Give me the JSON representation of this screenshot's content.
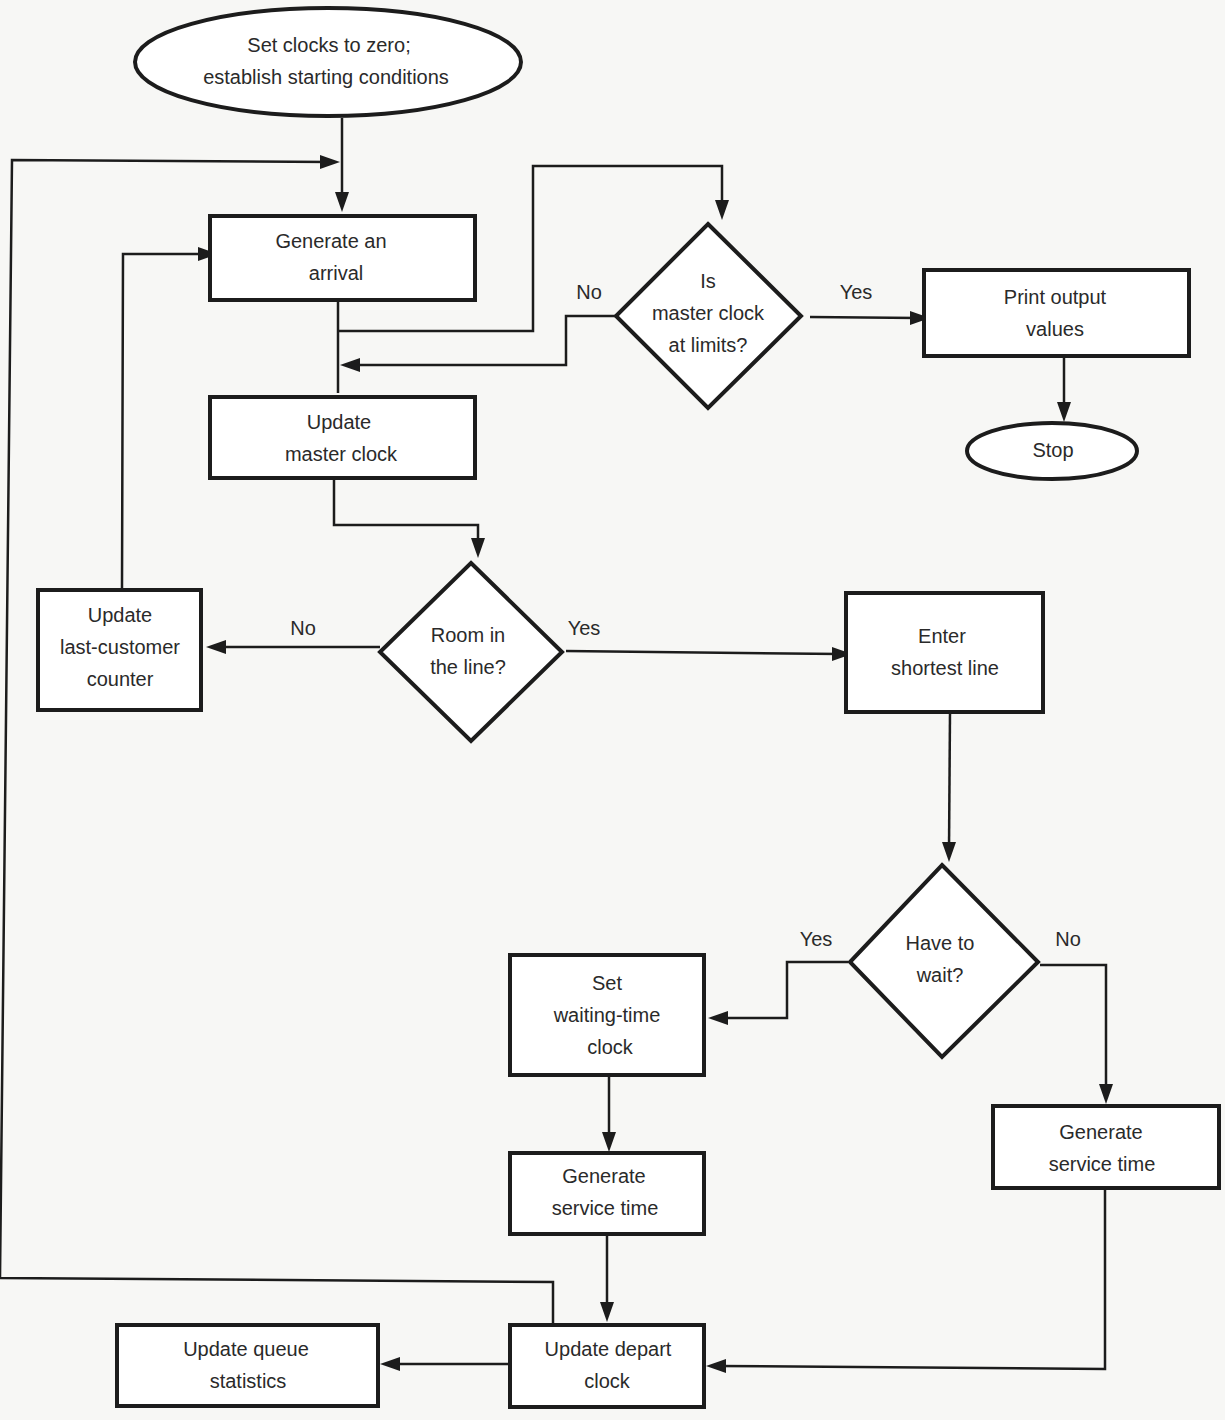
{
  "diagram": {
    "type": "flowchart",
    "nodes": {
      "start": {
        "shape": "ellipse",
        "lines": [
          "Set clocks to zero;",
          "establish starting conditions"
        ]
      },
      "generate_arrival": {
        "shape": "rect",
        "lines": [
          "Generate an",
          "arrival"
        ]
      },
      "master_clock_limits": {
        "shape": "diamond",
        "lines": [
          "Is",
          "master clock",
          "at limits?"
        ]
      },
      "print_output": {
        "shape": "rect",
        "lines": [
          "Print output",
          "values"
        ]
      },
      "stop": {
        "shape": "ellipse",
        "lines": [
          "Stop"
        ]
      },
      "update_master_clock": {
        "shape": "rect",
        "lines": [
          "Update",
          "master clock"
        ]
      },
      "room_in_line": {
        "shape": "diamond",
        "lines": [
          "Room in",
          "the line?"
        ]
      },
      "update_last_customer": {
        "shape": "rect",
        "lines": [
          "Update",
          "last-customer",
          "counter"
        ]
      },
      "enter_shortest_line": {
        "shape": "rect",
        "lines": [
          "Enter",
          "shortest line"
        ]
      },
      "have_to_wait": {
        "shape": "diamond",
        "lines": [
          "Have to",
          "wait?"
        ]
      },
      "set_waiting_clock": {
        "shape": "rect",
        "lines": [
          "Set",
          "waiting-time",
          "clock"
        ]
      },
      "generate_service_left": {
        "shape": "rect",
        "lines": [
          "Generate",
          "service time"
        ]
      },
      "generate_service_right": {
        "shape": "rect",
        "lines": [
          "Generate",
          "service time"
        ]
      },
      "update_depart_clock": {
        "shape": "rect",
        "lines": [
          "Update depart",
          "clock"
        ]
      },
      "update_queue_stats": {
        "shape": "rect",
        "lines": [
          "Update queue",
          "statistics"
        ]
      }
    },
    "branch_labels": {
      "limits_no": "No",
      "limits_yes": "Yes",
      "room_no": "No",
      "room_yes": "Yes",
      "wait_yes": "Yes",
      "wait_no": "No"
    },
    "edges": [
      {
        "from": "start",
        "to": "generate_arrival"
      },
      {
        "from": "generate_arrival",
        "to": "master_clock_limits"
      },
      {
        "from": "master_clock_limits",
        "to": "print_output",
        "label": "Yes"
      },
      {
        "from": "master_clock_limits",
        "to": "update_master_clock",
        "label": "No"
      },
      {
        "from": "print_output",
        "to": "stop"
      },
      {
        "from": "update_master_clock",
        "to": "room_in_line"
      },
      {
        "from": "room_in_line",
        "to": "update_last_customer",
        "label": "No"
      },
      {
        "from": "room_in_line",
        "to": "enter_shortest_line",
        "label": "Yes"
      },
      {
        "from": "update_last_customer",
        "to": "generate_arrival"
      },
      {
        "from": "enter_shortest_line",
        "to": "have_to_wait"
      },
      {
        "from": "have_to_wait",
        "to": "set_waiting_clock",
        "label": "Yes"
      },
      {
        "from": "have_to_wait",
        "to": "generate_service_right",
        "label": "No"
      },
      {
        "from": "set_waiting_clock",
        "to": "generate_service_left"
      },
      {
        "from": "generate_service_left",
        "to": "update_depart_clock"
      },
      {
        "from": "generate_service_right",
        "to": "update_depart_clock"
      },
      {
        "from": "update_depart_clock",
        "to": "update_queue_stats"
      },
      {
        "from": "update_depart_clock",
        "to": "generate_arrival"
      }
    ]
  }
}
